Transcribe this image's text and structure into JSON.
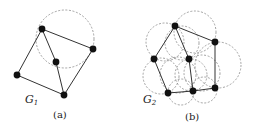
{
  "figures": [
    {
      "id": "a",
      "graph_label": "G",
      "graph_subscript": "1",
      "caption": "(a)",
      "nodes": [
        {
          "name": "top",
          "x": 42,
          "y": 29
        },
        {
          "name": "right",
          "x": 93,
          "y": 49
        },
        {
          "name": "center",
          "x": 56,
          "y": 62
        },
        {
          "name": "left",
          "x": 17,
          "y": 75
        },
        {
          "name": "bottom",
          "x": 64,
          "y": 95
        }
      ],
      "edges": [
        [
          "top",
          "right"
        ],
        [
          "top",
          "center"
        ],
        [
          "top",
          "left"
        ],
        [
          "center",
          "bottom"
        ],
        [
          "left",
          "bottom"
        ],
        [
          "right",
          "bottom"
        ]
      ],
      "circles": [
        {
          "cx": 65,
          "cy": 39,
          "r": 29
        }
      ]
    },
    {
      "id": "b",
      "graph_label": "G",
      "graph_subscript": "2",
      "caption": "(b)",
      "nodes": [
        {
          "name": "top",
          "x": 175,
          "y": 26
        },
        {
          "name": "right",
          "x": 215,
          "y": 42
        },
        {
          "name": "left",
          "x": 154,
          "y": 59
        },
        {
          "name": "center",
          "x": 189,
          "y": 59
        },
        {
          "name": "bottom-left",
          "x": 168,
          "y": 93
        },
        {
          "name": "bottom-middle",
          "x": 193,
          "y": 91
        },
        {
          "name": "bottom-right",
          "x": 215,
          "y": 88
        }
      ],
      "edges": [
        [
          "top",
          "right"
        ],
        [
          "top",
          "left"
        ],
        [
          "top",
          "center"
        ],
        [
          "right",
          "bottom-right"
        ],
        [
          "left",
          "bottom-left"
        ],
        [
          "center",
          "bottom-middle"
        ],
        [
          "bottom-left",
          "bottom-middle"
        ],
        [
          "bottom-middle",
          "bottom-right"
        ]
      ],
      "circles": [
        {
          "cx": 195,
          "cy": 32,
          "r": 21
        },
        {
          "cx": 165,
          "cy": 42,
          "r": 19
        },
        {
          "cx": 182,
          "cy": 43,
          "r": 17
        },
        {
          "cx": 218,
          "cy": 65,
          "r": 23
        },
        {
          "cx": 161,
          "cy": 76,
          "r": 18
        },
        {
          "cx": 178,
          "cy": 75,
          "r": 18
        },
        {
          "cx": 202,
          "cy": 73,
          "r": 18
        },
        {
          "cx": 181,
          "cy": 92,
          "r": 13
        },
        {
          "cx": 204,
          "cy": 90,
          "r": 13
        },
        {
          "cx": 191,
          "cy": 75,
          "r": 16
        }
      ]
    }
  ]
}
